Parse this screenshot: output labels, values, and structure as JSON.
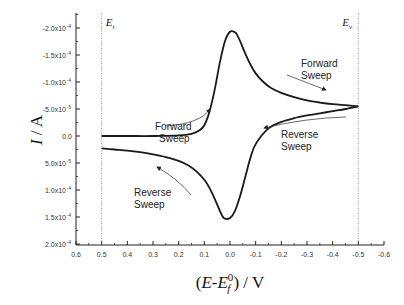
{
  "chart_data": {
    "type": "line",
    "title": "",
    "xlabel": "(E-E_f^0) / V",
    "xlabel_parts": {
      "open": "(",
      "E": "E",
      "dash": "-",
      "Ef": "E",
      "sup": "0",
      "sub": "f",
      "close": ") / V"
    },
    "ylabel": "I / A",
    "ylabel_parts": {
      "I": "I",
      "unit": " / A"
    },
    "xlim": [
      0.6,
      -0.6
    ],
    "ylim": [
      -0.00021,
      0.0002
    ],
    "y_inverted": true,
    "grid": false,
    "x_ticks": [
      0.6,
      0.5,
      0.4,
      0.3,
      0.2,
      0.1,
      0.0,
      -0.1,
      -0.2,
      -0.3,
      -0.4,
      -0.5,
      -0.6
    ],
    "x_tick_labels": [
      "0.6",
      "0.5",
      "0.4",
      "0.3",
      "0.2",
      "0.1",
      "0.0",
      "-0.1",
      "-0.2",
      "-0.3",
      "-0.4",
      "-0.5",
      "-0.6"
    ],
    "y_ticks": [
      -0.0002,
      -0.00015,
      -0.0001,
      -5e-05,
      0,
      5e-05,
      0.0001,
      0.00015,
      0.0002
    ],
    "y_tick_labels": [
      {
        "mant": "-2.0x10",
        "exp": "-4"
      },
      {
        "mant": "-1.5x10",
        "exp": "-4"
      },
      {
        "mant": "-1.0x10",
        "exp": "-4"
      },
      {
        "mant": "-5.0x10",
        "exp": "-5"
      },
      {
        "mant": "0.0",
        "exp": ""
      },
      {
        "mant": "5.0x10",
        "exp": "-5"
      },
      {
        "mant": "1.0x10",
        "exp": "-4"
      },
      {
        "mant": "1.5x10",
        "exp": "-4"
      },
      {
        "mant": "2.0x10",
        "exp": "-4"
      }
    ],
    "vertical_markers": [
      {
        "x": 0.5,
        "label": "E",
        "sub": "i"
      },
      {
        "x": -0.5,
        "label": "E",
        "sub": "v"
      }
    ],
    "series": [
      {
        "name": "Forward Sweep",
        "x": [
          0.5,
          0.4,
          0.3,
          0.2,
          0.15,
          0.12,
          0.1,
          0.08,
          0.06,
          0.04,
          0.02,
          0.0,
          -0.02,
          -0.03,
          -0.04,
          -0.06,
          -0.08,
          -0.1,
          -0.13,
          -0.16,
          -0.2,
          -0.25,
          -0.3,
          -0.35,
          -0.4,
          -0.45,
          -0.5
        ],
        "y": [
          0,
          0,
          0,
          -1e-06,
          -4e-06,
          -1e-05,
          -2e-05,
          -4.5e-05,
          -8.5e-05,
          -0.000135,
          -0.000175,
          -0.000193,
          -0.000192,
          -0.000185,
          -0.000175,
          -0.000152,
          -0.000132,
          -0.000116,
          -0.0001,
          -8.9e-05,
          -8e-05,
          -7.2e-05,
          -6.6e-05,
          -6.2e-05,
          -5.9e-05,
          -5.7e-05,
          -5.5e-05
        ]
      },
      {
        "name": "Reverse Sweep",
        "x": [
          -0.5,
          -0.45,
          -0.4,
          -0.35,
          -0.3,
          -0.25,
          -0.2,
          -0.15,
          -0.1,
          -0.08,
          -0.06,
          -0.04,
          -0.02,
          0.0,
          0.02,
          0.03,
          0.04,
          0.06,
          0.08,
          0.1,
          0.13,
          0.16,
          0.2,
          0.25,
          0.3,
          0.35,
          0.4,
          0.45,
          0.5
        ],
        "y": [
          -5.5e-05,
          -5e-05,
          -4.6e-05,
          -4.2e-05,
          -3.8e-05,
          -3.3e-05,
          -2.6e-05,
          -1.4e-05,
          1.5e-05,
          4e-05,
          7.5e-05,
          0.00011,
          0.000138,
          0.000152,
          0.000153,
          0.000148,
          0.000138,
          0.000116,
          9.6e-05,
          8.1e-05,
          6.6e-05,
          5.5e-05,
          4.6e-05,
          3.9e-05,
          3.4e-05,
          3e-05,
          2.7e-05,
          2.5e-05,
          2.3e-05
        ]
      }
    ],
    "annotations": [
      {
        "line1": "Forward",
        "line2": "Sweep",
        "near": "rising forward branch",
        "arrow": "up-right"
      },
      {
        "line1": "Forward",
        "line2": "Sweep",
        "near": "forward decay toward vertex",
        "arrow": "down-right"
      },
      {
        "line1": "Reverse",
        "line2": "Sweep",
        "near": "reverse branch near vertex",
        "arrow": "left"
      },
      {
        "line1": "Reverse",
        "line2": "Sweep",
        "near": "reverse tail near start",
        "arrow": "up-left"
      }
    ]
  }
}
